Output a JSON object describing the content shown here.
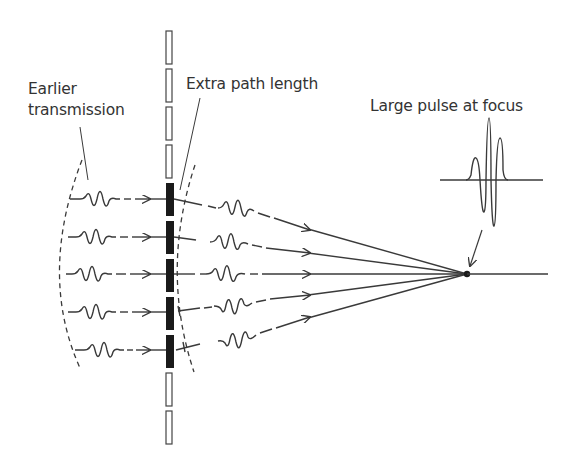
{
  "labels": {
    "earlier_transmission_line1": "Earlier",
    "earlier_transmission_line2": "transmission",
    "extra_path_length": "Extra path length",
    "large_pulse": "Large pulse at focus"
  },
  "colors": {
    "stroke": "#3a3a3a",
    "element_active": "#1a1a1a",
    "background": "#ffffff"
  },
  "array": {
    "inactive_elements": 6,
    "active_elements": 5
  },
  "rows": [
    {
      "y": 199,
      "wavelet_left_x": 72,
      "out_end": [
        255,
        212
      ]
    },
    {
      "y": 237,
      "wavelet_left_x": 70,
      "out_end": [
        250,
        244
      ]
    },
    {
      "y": 274,
      "wavelet_left_x": 68,
      "out_end": [
        245,
        274
      ]
    },
    {
      "y": 312,
      "wavelet_left_x": 70,
      "out_end": [
        250,
        304
      ]
    },
    {
      "y": 350,
      "wavelet_left_x": 74,
      "out_end": [
        255,
        334
      ]
    }
  ],
  "focus": {
    "x": 467,
    "y": 274
  }
}
